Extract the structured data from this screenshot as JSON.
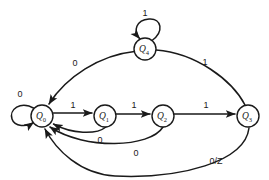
{
  "diagram": {
    "type": "state-transition-diagram",
    "title": "",
    "states": [
      {
        "id": "Q0",
        "base": "Q",
        "subscript": "0",
        "cx": 42,
        "cy": 116,
        "r": 11
      },
      {
        "id": "Q1",
        "base": "Q",
        "subscript": "1",
        "cx": 105,
        "cy": 116,
        "r": 11
      },
      {
        "id": "Q2",
        "base": "Q",
        "subscript": "2",
        "cx": 163,
        "cy": 116,
        "r": 11
      },
      {
        "id": "Q3",
        "base": "Q",
        "subscript": "3",
        "cx": 248,
        "cy": 116,
        "r": 11
      },
      {
        "id": "Q4",
        "base": "Q",
        "subscript": "4",
        "cx": 145,
        "cy": 49,
        "r": 11
      }
    ],
    "transitions": [
      {
        "from": "Q0",
        "to": "Q0",
        "label": "0",
        "kind": "self-loop",
        "label_x": 20,
        "label_y": 94
      },
      {
        "from": "Q0",
        "to": "Q1",
        "label": "1",
        "kind": "straight",
        "label_x": 73,
        "label_y": 106
      },
      {
        "from": "Q1",
        "to": "Q2",
        "label": "1",
        "kind": "straight",
        "label_x": 134,
        "label_y": 106
      },
      {
        "from": "Q2",
        "to": "Q3",
        "label": "1",
        "kind": "straight",
        "label_x": 206,
        "label_y": 106
      },
      {
        "from": "Q3",
        "to": "Q4",
        "label": "1",
        "kind": "arc-top",
        "label_x": 205,
        "label_y": 62
      },
      {
        "from": "Q4",
        "to": "Q4",
        "label": "1",
        "kind": "self-loop",
        "label_x": 145,
        "label_y": 13
      },
      {
        "from": "Q4",
        "to": "Q0",
        "label": "0",
        "kind": "arc-top",
        "label_x": 75,
        "label_y": 63
      },
      {
        "from": "Q1",
        "to": "Q0",
        "label": "0",
        "kind": "arc-bottom",
        "label_x": 100,
        "label_y": 139
      },
      {
        "from": "Q2",
        "to": "Q0",
        "label": "0",
        "kind": "arc-bottom",
        "label_x": 136,
        "label_y": 152
      },
      {
        "from": "Q3",
        "to": "Q0",
        "label": "0/Z",
        "kind": "arc-bottom",
        "label_x": 216,
        "label_y": 160
      }
    ],
    "edge_labels": [
      "0",
      "1",
      "1",
      "1",
      "1",
      "1",
      "0",
      "0",
      "0",
      "0/Z"
    ],
    "colors": {
      "stroke": "#1a1a1a",
      "node_fill": "#ffffff",
      "background": "#ffffff"
    }
  }
}
